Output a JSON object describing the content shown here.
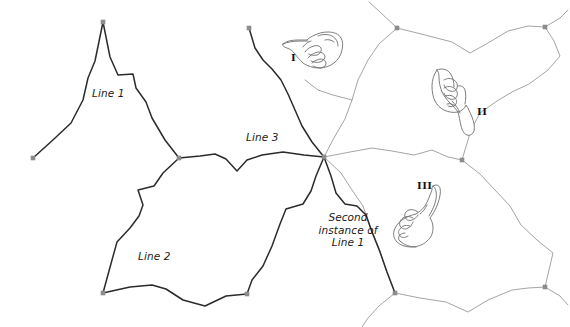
{
  "figure": {
    "type": "diagram",
    "background_color": "#ffffff",
    "dark_line_color": "#2b2b2b",
    "light_line_color": "#9a9a9a",
    "node_color": "#8c8c8c",
    "hand_outline_color": "#6e6e6e"
  },
  "labels": [
    {
      "id": "line-1",
      "text": "Line 1",
      "x": 92,
      "y": 87,
      "style": "italic"
    },
    {
      "id": "line-2",
      "text": "Line 2",
      "x": 138,
      "y": 250,
      "style": "italic"
    },
    {
      "id": "line-3",
      "text": "Line 3",
      "x": 246,
      "y": 131,
      "style": "italic"
    },
    {
      "id": "second-instance-line-1",
      "text": "Second instance of Line 1",
      "x": 306,
      "y": 211,
      "style": "italic"
    }
  ],
  "label_second_instance": {
    "line_1": "Second",
    "line_2": "instance of",
    "line_3": "Line 1"
  },
  "numerals": [
    {
      "id": "numeral-i",
      "text": "I",
      "x": 291,
      "y": 52
    },
    {
      "id": "numeral-ii",
      "text": "II",
      "x": 477,
      "y": 106
    },
    {
      "id": "numeral-iii",
      "text": "III",
      "x": 417,
      "y": 180
    }
  ],
  "hands": [
    {
      "id": "hand-i",
      "direction": "points-left",
      "numeral": "I",
      "cx": 311,
      "cy": 44
    },
    {
      "id": "hand-ii",
      "direction": "points-down-left",
      "numeral": "II",
      "cx": 455,
      "cy": 92
    },
    {
      "id": "hand-iii",
      "direction": "points-up-right",
      "numeral": "III",
      "cx": 427,
      "cy": 212
    }
  ],
  "nodes": [
    {
      "id": "node-left-end",
      "x": 33,
      "y": 158
    },
    {
      "id": "node-top-peak",
      "x": 103,
      "y": 22
    },
    {
      "id": "node-mid-left",
      "x": 179,
      "y": 158
    },
    {
      "id": "node-bottom-left",
      "x": 103,
      "y": 293
    },
    {
      "id": "node-bottom-mid",
      "x": 247,
      "y": 294
    },
    {
      "id": "node-line3-end",
      "x": 249,
      "y": 28
    },
    {
      "id": "node-hub",
      "x": 324,
      "y": 157
    },
    {
      "id": "node-upper-gray",
      "x": 397,
      "y": 28
    },
    {
      "id": "node-right-upper",
      "x": 545,
      "y": 27
    },
    {
      "id": "node-right-lower",
      "x": 545,
      "y": 287
    },
    {
      "id": "node-bottom-gray",
      "x": 395,
      "y": 293
    },
    {
      "id": "node-gray-mid",
      "x": 462,
      "y": 160
    }
  ],
  "dark_paths": [
    {
      "id": "path-line-1",
      "points": "33,158 54,139 71,123 83,100 88,78 95,61 103,22 110,57 118,75 133,74 136,88 146,102 152,118 165,140 179,158"
    },
    {
      "id": "path-line-2",
      "points": "179,158 163,173 154,186 138,190 143,205 139,216 130,228 117,242 112,260 103,293 130,287 152,285 166,289 183,300 205,306 226,296 247,294"
    },
    {
      "id": "path-line-3-left",
      "points": "179,158 200,156 215,154 226,159 237,171 247,160 262,155 283,152 304,155 324,157"
    },
    {
      "id": "path-line-3-up",
      "points": "249,28 255,48 263,60 272,69 281,80 288,94 295,110 302,126 312,142 324,157"
    },
    {
      "id": "path-second-instance-left",
      "points": "324,157 316,176 311,191 303,204 286,209 280,224 272,246 263,266 252,280 247,294"
    },
    {
      "id": "path-second-instance-right",
      "points": "324,157 331,176 336,193 345,204 357,206 366,215 372,232 380,252 387,272 395,293"
    }
  ],
  "light_paths": [
    {
      "id": "gray-hub-up",
      "points": "324,157 335,136 345,119 352,100 358,80 368,60 379,44 397,28"
    },
    {
      "id": "gray-hub-right",
      "points": "324,157 350,152 372,148 392,151 414,155 432,150 448,157 462,160"
    },
    {
      "id": "gray-hub-downright",
      "points": "324,157 341,173 352,190 363,206 370,226 379,248 386,270 395,293"
    },
    {
      "id": "gray-top-left-edge",
      "points": "397,28 380,12 369,2"
    },
    {
      "id": "gray-top-right",
      "points": "397,28 425,35 452,42 470,53 488,43 508,31 528,26 545,27"
    },
    {
      "id": "gray-right-upper",
      "points": "545,27 554,41 560,56 548,70 529,84 512,92 497,101 480,113 471,130 462,160"
    },
    {
      "id": "gray-right-down",
      "points": "462,160 480,174 495,190 510,206 521,225 537,240 553,253 545,287"
    },
    {
      "id": "gray-bottom",
      "points": "395,293 420,298 446,302 468,312 488,300 512,290 528,288 545,287"
    },
    {
      "id": "gray-bottom-left",
      "points": "395,293 379,306 368,318 362,327"
    },
    {
      "id": "gray-right-tail",
      "points": "545,27 560,18 568,10"
    },
    {
      "id": "gray-right-lowtail",
      "points": "545,287 560,296 568,305"
    },
    {
      "id": "gray-left-cell",
      "points": "352,100 333,95 318,90 305,80"
    }
  ]
}
